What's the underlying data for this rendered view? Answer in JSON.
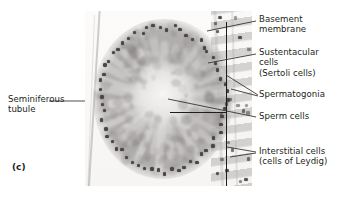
{
  "figure": {
    "panel_letter": "(c)",
    "image_kind": "histology-micrograph"
  },
  "labels": {
    "basement_membrane": "Basement\nmembrane",
    "sustentacular_cells": "Sustentacular\ncells\n(Sertoli cells)",
    "spermatogonia": "Spermatogonia",
    "sperm_cells": "Sperm cells",
    "interstitial_cells": "Interstitial cells\n(cells of Leydig)",
    "seminiferous_tubule": "Seminiferous\ntubule"
  },
  "colors": {
    "text": "#231f20",
    "leader_line": "#231f20",
    "bracket": "#1d1d1b",
    "background": "#ffffff",
    "tissue_mid": "#a4a1a0",
    "nucleus_dark": "#4a4745"
  }
}
